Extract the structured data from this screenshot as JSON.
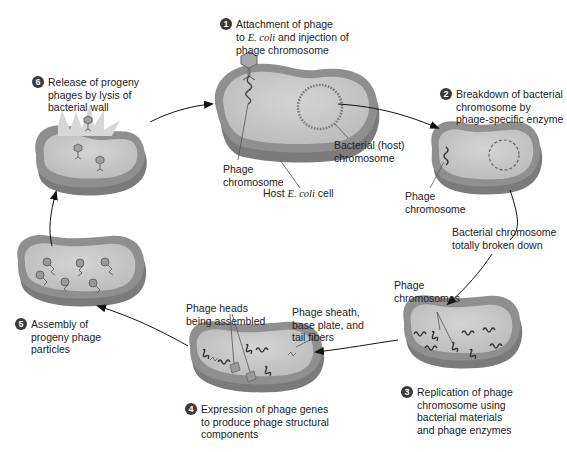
{
  "diagram": {
    "colors": {
      "cell_fill": "#c9c9c9",
      "cell_rim": "#8d8d8d",
      "cell_shadow": "#7a7a7a",
      "chromosome": "#555555",
      "arrow": "#111111",
      "text": "#222222"
    },
    "steps": [
      {
        "number": "1",
        "text_a": "Attachment of phage",
        "text_b_pre": "to ",
        "text_b_ital": "E. coli",
        "text_b_post": " and injection of",
        "text_c": "phage chromosome"
      },
      {
        "number": "2",
        "text": "Breakdown of bacterial\nchromosome by\nphage-specific enzyme"
      },
      {
        "number": "3",
        "text": "Replication of phage\nchromosome using\nbacterial materials\nand phage enzymes"
      },
      {
        "number": "4",
        "text": "Expression of phage genes\nto produce phage structural\ncomponents"
      },
      {
        "number": "5",
        "text": "Assembly of\nprogeny phage\nparticles"
      },
      {
        "number": "6",
        "text": "Release of progeny\nphages by lysis of\nbacterial wall"
      }
    ],
    "labels": {
      "phage_chromosome_1": "Phage\nchromosome",
      "bacterial_host_chromosome": "Bacterial (host)\nchromosome",
      "host_cell_pre": "Host ",
      "host_cell_ital": "E. coli",
      "host_cell_post": " cell",
      "phage_chromosome_2": "Phage\nchromosome",
      "bacterial_chromosome_broken": "Bacterial chromosome\ntotally broken down",
      "phage_chromosomes": "Phage\nchromosomes",
      "phage_heads": "Phage heads\nbeing assembled",
      "phage_sheath": "Phage sheath,\nbase plate, and\ntail fibers"
    }
  }
}
